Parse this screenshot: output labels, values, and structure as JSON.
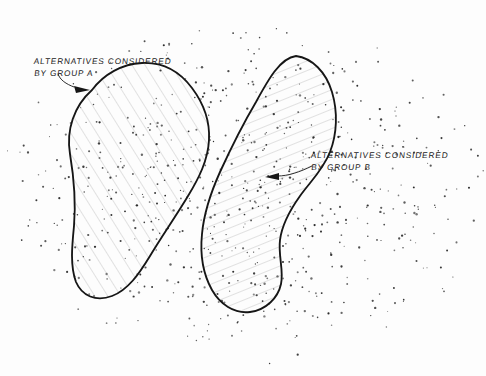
{
  "diagram": {
    "style": "hand-drawn pencil sketch on white paper",
    "background_color": "#fdfdfd",
    "ink_color": "#1a1a1a",
    "hatch_color": "#9a9a9a",
    "stipple_color": "#2a2a2a"
  },
  "labels": {
    "group_a": {
      "line1": "ALTERNATIVES CONSIDERED",
      "line2": "BY GROUP A"
    },
    "group_b": {
      "line1": "ALTERNATIVES CONSIDERED",
      "line2": "BY GROUP B"
    }
  },
  "regions": [
    {
      "name": "group-a-blob",
      "label_ref": "group_a",
      "hatch": "diagonal lines rising left-to-right (approx +30 degrees)",
      "orientation": "upper-left to lower-left, tall lobe"
    },
    {
      "name": "group-b-blob",
      "label_ref": "group_b",
      "hatch": "diagonal lines falling left-to-right (approx -65 degrees)",
      "orientation": "upper-right peak sweeping down to lower-centre"
    },
    {
      "name": "overlap-lens",
      "label_ref": null,
      "hatch": "cross-hatch, both directions overlaid",
      "orientation": "central lens where group A and group B intersect"
    }
  ],
  "annotations": {
    "leader_a": "curved leader line from the Group A caption to an arrowhead on the upper-left edge of the Group A blob",
    "leader_b": "curved leader line from the Group B caption to an arrowhead on the lower-left edge of the Group B blob"
  },
  "stipple": {
    "description": "scattered ink dots representing the full space of possible alternatives",
    "approx_count": 720,
    "distribution": "dense in the centre, thinning toward the page edges"
  }
}
